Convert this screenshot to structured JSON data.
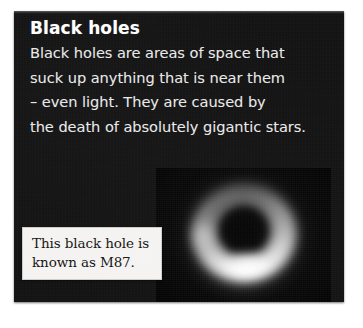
{
  "card": {
    "title": "Black holes",
    "body_lines": [
      "Black holes are areas of space that",
      "suck up anything that is near them",
      "– even light. They are caused by",
      "the death of absolutely gigantic stars."
    ],
    "body_text": "Black holes are areas of space that suck up anything that is near them – even light. They are caused by the death of absolutely gigantic stars.",
    "background_color": "#131313",
    "title_color": "#ffffff",
    "body_color": "#e9e9e9"
  },
  "photo": {
    "subject": "black-hole-photograph",
    "alt": "Photograph of the M87 black hole: a bright orange-white ring of glowing gas around a dark circular shadow, brightest along the lower arc.",
    "background_color": "#060607",
    "ring_color": "#ffffff",
    "core_color": "#050506"
  },
  "caption": {
    "lines": [
      "This black hole is",
      "known as M87."
    ],
    "text": "This black hole is known as M87.",
    "background_color": "#f4f3f1",
    "text_color": "#151515"
  },
  "page": {
    "background_color": "#ffffff"
  }
}
